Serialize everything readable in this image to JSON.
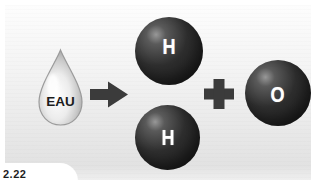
{
  "figure": {
    "number": "2.22"
  },
  "diagram": {
    "reactant": {
      "label": "EAU"
    },
    "arrow_icon": "arrow-right",
    "plus_icon": "plus",
    "products": {
      "hydrogen_top": "H",
      "hydrogen_bottom": "H",
      "oxygen": "O"
    }
  },
  "colors": {
    "sphere_dark": "#1e1e1e",
    "sphere_highlight": "#989898",
    "symbol_gray": "#3b3b3b",
    "panel_top": "#fdfdfd",
    "panel_bottom": "#e2e2e2",
    "atom_letter": "#ffffff",
    "drop_label_text": "#1c1c1c"
  }
}
